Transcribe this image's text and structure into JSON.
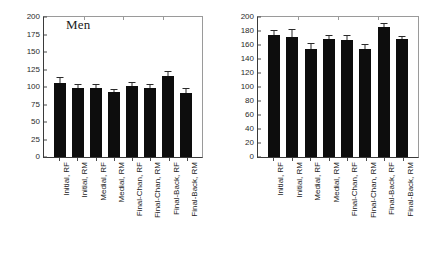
{
  "figure": {
    "background": "#ffffff",
    "bar_color": "#0d0d0d",
    "axis_color": "#3a3a3a"
  },
  "chart_data": [
    {
      "type": "bar",
      "title": "Men",
      "xlabel": "",
      "ylabel": "",
      "ylim": [
        0,
        200
      ],
      "yticks": [
        0,
        25,
        50,
        75,
        100,
        125,
        150,
        175,
        200
      ],
      "grid": false,
      "legend": "none",
      "categories": [
        "Initial, RF",
        "Initial, RM",
        "Medial, RF",
        "Medial, RM",
        "Final-Chan, RF",
        "Final-Chan, RM",
        "Final-Back, RF",
        "Final-Back, RM"
      ],
      "values": [
        106,
        99,
        99,
        93,
        101,
        98,
        116,
        92
      ],
      "errors": [
        8,
        5,
        5,
        4,
        6,
        6,
        7,
        6
      ]
    },
    {
      "type": "bar",
      "title": "Women",
      "xlabel": "",
      "ylabel": "",
      "ylim": [
        0,
        200
      ],
      "yticks": [
        0,
        20,
        40,
        60,
        80,
        100,
        120,
        140,
        160,
        180,
        200
      ],
      "grid": false,
      "legend": "none",
      "categories": [
        "Initial, RF",
        "Initial, RM",
        "Medial, RF",
        "Medial, RM",
        "Final-Chan, RF",
        "Final-Chan, RM",
        "Final-Back, RF",
        "Final-Back, RM"
      ],
      "values": [
        174,
        172,
        155,
        169,
        167,
        154,
        186,
        168
      ],
      "errors": [
        8,
        11,
        8,
        5,
        7,
        8,
        5,
        5
      ]
    }
  ]
}
